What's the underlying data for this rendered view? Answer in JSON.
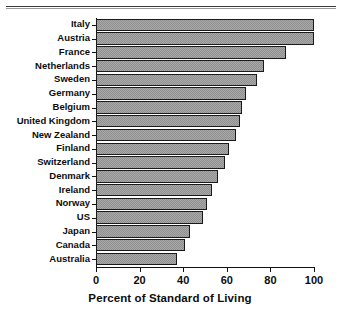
{
  "chart_data": {
    "type": "bar",
    "orientation": "horizontal",
    "title": "",
    "xlabel": "Percent of Standard of Living",
    "ylabel": "",
    "xlim": [
      0,
      100
    ],
    "xticks": [
      0,
      20,
      40,
      60,
      80,
      100
    ],
    "grid": false,
    "legend": null,
    "bar_color": "#a9a9a9",
    "bar_edge_color": "#1a1a1a",
    "categories": [
      "Italy",
      "Austria",
      "France",
      "Netherlands",
      "Sweden",
      "Germany",
      "Belgium",
      "United Kingdom",
      "New Zealand",
      "Finland",
      "Switzerland",
      "Denmark",
      "Ireland",
      "Norway",
      "US",
      "Japan",
      "Canada",
      "Australia"
    ],
    "values": [
      100,
      100,
      87,
      77,
      74,
      69,
      67,
      66,
      64,
      61,
      59,
      56,
      53,
      51,
      49,
      43,
      41,
      37
    ]
  }
}
